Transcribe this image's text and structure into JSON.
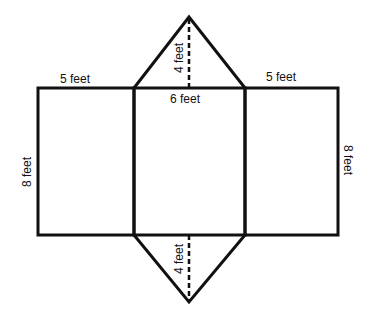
{
  "diagram": {
    "type": "triangular prism net",
    "colors": {
      "stroke": "#111111",
      "background": "#ffffff"
    },
    "labels": {
      "left_rect_top": "5 feet",
      "right_rect_top": "5 feet",
      "center_top": "6 feet",
      "left_height": "8 feet",
      "right_height": "8 feet",
      "top_triangle_height": "4 feet",
      "bottom_triangle_height": "4 feet"
    },
    "faces": [
      {
        "name": "left-rectangle",
        "width": "5 feet",
        "height": "8 feet"
      },
      {
        "name": "center-rectangle",
        "width": "6 feet",
        "height": "8 feet"
      },
      {
        "name": "right-rectangle",
        "width": "5 feet",
        "height": "8 feet"
      },
      {
        "name": "top-triangle",
        "base": "6 feet",
        "height": "4 feet"
      },
      {
        "name": "bottom-triangle",
        "base": "6 feet",
        "height": "4 feet"
      }
    ]
  }
}
